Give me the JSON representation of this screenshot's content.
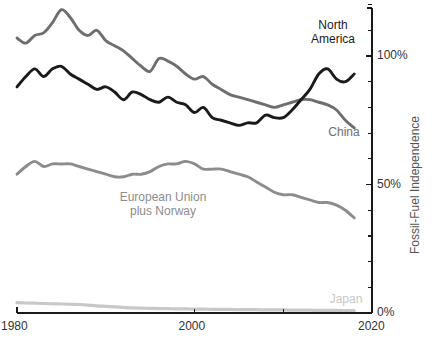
{
  "chart_data": {
    "type": "line",
    "title": "",
    "xlabel": "",
    "ylabel": "Fossil-Fuel Independence",
    "xlim": [
      1980,
      2020
    ],
    "ylim": [
      0,
      130
    ],
    "grid": false,
    "legend_position": "inline-labels",
    "x_ticks": [
      "1980",
      "2000",
      "2020"
    ],
    "x_tick_values": [
      1980,
      2000,
      2020
    ],
    "y_ticks": [
      "0%",
      "50%",
      "100%"
    ],
    "y_tick_values": [
      0,
      50,
      100
    ],
    "y_minor_tick_values": [
      10,
      20,
      30,
      40,
      60,
      70,
      80,
      90,
      110,
      120,
      130
    ],
    "x": [
      1980,
      1981,
      1982,
      1983,
      1984,
      1985,
      1986,
      1987,
      1988,
      1989,
      1990,
      1991,
      1992,
      1993,
      1994,
      1995,
      1996,
      1997,
      1998,
      1999,
      2000,
      2001,
      2002,
      2003,
      2004,
      2005,
      2006,
      2007,
      2008,
      2009,
      2010,
      2011,
      2012,
      2013,
      2014,
      2015,
      2016,
      2017,
      2018
    ],
    "series": [
      {
        "name": "North America",
        "color": "#1a1a1a",
        "label_text": "North America",
        "values": [
          88,
          92,
          95,
          92,
          95,
          96,
          93,
          91,
          89,
          87,
          88,
          86,
          83,
          86,
          85,
          83,
          82,
          84,
          82,
          81,
          78,
          80,
          76,
          75,
          74,
          73,
          74,
          74,
          77,
          76,
          76,
          79,
          83,
          87,
          93,
          95,
          91,
          90,
          93
        ]
      },
      {
        "name": "China",
        "color": "#6e6e6e",
        "label_text": "China",
        "values": [
          107,
          105,
          108,
          109,
          113,
          118,
          115,
          110,
          108,
          110,
          106,
          104,
          102,
          99,
          96,
          94,
          99,
          98,
          96,
          93,
          91,
          92,
          89,
          87,
          85,
          84,
          83,
          82,
          81,
          80,
          81,
          82,
          83,
          83,
          82,
          81,
          79,
          75,
          72
        ]
      },
      {
        "name": "European Union plus Norway",
        "color": "#8c8c8c",
        "label_text": "European Union plus Norway",
        "values": [
          54,
          57,
          59,
          57,
          58,
          58,
          58,
          57,
          56,
          55,
          54,
          53,
          53,
          54,
          54,
          55,
          57,
          58,
          58,
          59,
          58,
          56,
          56,
          56,
          55,
          54,
          53,
          51,
          49,
          47,
          46,
          46,
          45,
          44,
          43,
          43,
          42,
          40,
          37
        ]
      },
      {
        "name": "Japan",
        "color": "#c8c8c8",
        "label_text": "Japan",
        "values": [
          4.0,
          3.9,
          3.8,
          3.7,
          3.6,
          3.5,
          3.4,
          3.3,
          3.1,
          2.8,
          2.6,
          2.4,
          2.2,
          2.0,
          1.9,
          1.8,
          1.7,
          1.7,
          1.6,
          1.6,
          1.5,
          1.5,
          1.4,
          1.4,
          1.4,
          1.3,
          1.3,
          1.3,
          1.2,
          1.2,
          1.2,
          1.1,
          1.1,
          1.1,
          1.0,
          1.0,
          1.0,
          0.9,
          0.9
        ]
      }
    ],
    "annotations": [
      {
        "text": "North America",
        "series": "North America"
      },
      {
        "text": "China",
        "series": "China"
      },
      {
        "text": "European Union\nplus Norway",
        "series": "European Union plus Norway"
      },
      {
        "text": "Japan",
        "series": "Japan"
      }
    ]
  },
  "axis": {
    "y_axis_title": "Fossil-Fuel Independence",
    "y_tick_0": "0%",
    "y_tick_50": "50%",
    "y_tick_100": "100%",
    "x_tick_1980": "1980",
    "x_tick_2000": "2000",
    "x_tick_2020": "2020",
    "axis_color": "#1a1a1a",
    "tick_label_color": "#333333"
  },
  "labels": {
    "north_america": "North\nAmerica",
    "china": "China",
    "european_union": "European Union\nplus Norway",
    "japan": "Japan"
  },
  "colors": {
    "north_america": "#1a1a1a",
    "china": "#6e6e6e",
    "european_union": "#8c8c8c",
    "japan": "#c8c8c8",
    "background": "#ffffff"
  }
}
